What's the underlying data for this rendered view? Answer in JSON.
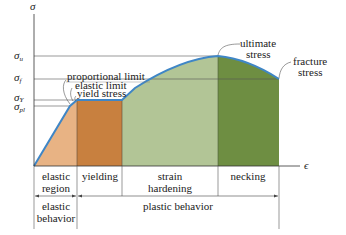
{
  "axes": {
    "y_label": "σ",
    "x_label": "ϵ",
    "y_ticks": [
      {
        "sym": "σ",
        "sub": "u",
        "name": "ultimate"
      },
      {
        "sym": "σ",
        "sub": "f",
        "name": "fracture"
      },
      {
        "sym": "σ",
        "sub": "Y",
        "name": "yield"
      },
      {
        "sym": "σ",
        "sub": "pl",
        "name": "proportional"
      }
    ]
  },
  "annotations": {
    "proportional_limit": "proportional limit",
    "elastic_limit": "elastic limit",
    "yield_stress": "yield stress",
    "ultimate_line1": "ultimate",
    "ultimate_line2": "stress",
    "fracture_line1": "fracture",
    "fracture_line2": "stress"
  },
  "regions": [
    {
      "line1": "elastic",
      "line2": "region",
      "color": "#e3a574"
    },
    {
      "line1": "yielding",
      "line2": "",
      "color": "#c87a3a"
    },
    {
      "line1": "strain",
      "line2": "hardening",
      "color": "#a9bd8c"
    },
    {
      "line1": "necking",
      "line2": "",
      "color": "#6b8a3c"
    }
  ],
  "behaviors": [
    {
      "line1": "elastic",
      "line2": "behavior"
    },
    {
      "line1": "plastic behavior",
      "line2": ""
    }
  ],
  "colors": {
    "curve": "#3f86c6",
    "axis": "#333333",
    "gridline": "#555555"
  }
}
